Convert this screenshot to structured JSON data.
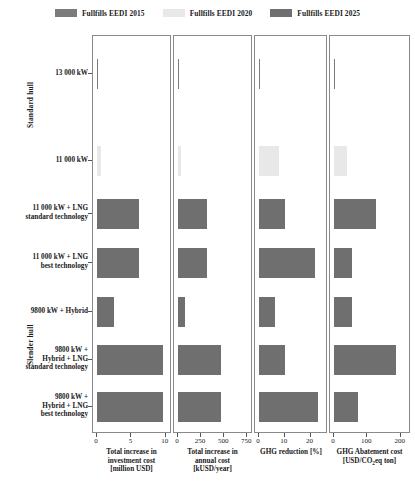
{
  "legend": {
    "items": [
      {
        "label": "Fullfills EEDI 2015",
        "color": "#7b7b7b"
      },
      {
        "label": "Fullfills EEDI 2020",
        "color": "#e8e8e8"
      },
      {
        "label": "Fullfills EEDI 2025",
        "color": "#6f6f6f"
      }
    ]
  },
  "group_labels": [
    {
      "name": "Standard hull"
    },
    {
      "name": "Slender hull"
    }
  ],
  "chart_data": {
    "type": "bar",
    "title": "",
    "orientation": "horizontal",
    "grid": false,
    "legend_position": "top",
    "categories": [
      "13 000 kW",
      "11 000 kW",
      "11 000 kW + LNG\nstandard technology",
      "11 000 kW + LNG\nbest technology",
      "9800 kW + Hybrid",
      "9800 kW +\nHybrid + LNG\nstandard technology",
      "9800 kW +\nHybrid + LNG\nbest technology"
    ],
    "category_groups": [
      "Standard hull",
      "Standard hull",
      "Slender hull",
      "Slender hull",
      "Slender hull",
      "Slender hull",
      "Slender hull"
    ],
    "eedi_class": [
      "2015",
      "2020",
      "2025",
      "2025",
      "2025",
      "2025",
      "2025"
    ],
    "panels": [
      {
        "xlabel": "Total increase in\ninvestment cost\n[million USD]",
        "ticks": [
          0,
          5,
          10
        ],
        "ticklabels": [
          "0",
          "5",
          "10"
        ],
        "xlim": [
          0,
          10.6
        ],
        "values": [
          0.0,
          0.55,
          6.2,
          6.2,
          2.5,
          9.9,
          9.9
        ]
      },
      {
        "xlabel": "Total increase in\nannual cost\n[kUSD/year]",
        "ticks": [
          0,
          250,
          500,
          750
        ],
        "ticklabels": [
          "0",
          "250",
          "500",
          "750"
        ],
        "xlim": [
          0,
          790
        ],
        "values": [
          0,
          35,
          320,
          320,
          75,
          480,
          480
        ]
      },
      {
        "xlabel": "GHG reduction [%]",
        "ticks": [
          0,
          10,
          20
        ],
        "ticklabels": [
          "0",
          "10",
          "20"
        ],
        "xlim": [
          0,
          26
        ],
        "values": [
          0,
          8.0,
          10.5,
          22.5,
          6.5,
          10.5,
          23.5
        ]
      },
      {
        "xlabel": "GHG Abatement cost\n[USD/CO₂eq ton]",
        "xlabel_html": "GHG Abatement cost<br>[USD/CO<sub>2</sub>eq ton]",
        "ticks": [
          0,
          100,
          200
        ],
        "ticklabels": [
          "0",
          "100",
          "200"
        ],
        "xlim": [
          0,
          225
        ],
        "values": [
          0,
          40,
          130,
          55,
          55,
          190,
          75
        ]
      }
    ]
  }
}
